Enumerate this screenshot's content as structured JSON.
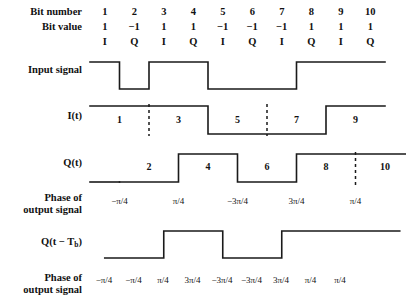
{
  "figure": {
    "type": "timing-diagram"
  },
  "rows": {
    "bit_number_label": "Bit number",
    "bit_value_label": "Bit value",
    "input_signal_label": "Input signal",
    "i_label": "I(t)",
    "q_label": "Q(t)",
    "q_delayed_label": "Q(t − T",
    "q_delayed_sub": "b",
    "q_delayed_tail": ")",
    "phase_label_line1": "Phase of",
    "phase_label_line2": "output signal"
  },
  "bits": {
    "numbers": [
      "1",
      "2",
      "3",
      "4",
      "5",
      "6",
      "7",
      "8",
      "9",
      "10"
    ],
    "values": [
      "1",
      "−1",
      "1",
      "1",
      "−1",
      "−1",
      "−1",
      "1",
      "1",
      "1"
    ],
    "channels": [
      "I",
      "Q",
      "I",
      "Q",
      "I",
      "Q",
      "I",
      "Q",
      "I",
      "Q"
    ]
  },
  "input_signal": {
    "levels": [
      1,
      -1,
      1,
      1,
      -1,
      -1,
      -1,
      1,
      1,
      1
    ]
  },
  "i_channel": {
    "labels": [
      "1",
      "3",
      "5",
      "7",
      "9"
    ],
    "levels": [
      1,
      1,
      -1,
      -1,
      1
    ],
    "dashed_after": [
      0,
      2
    ]
  },
  "q_channel": {
    "labels": [
      "2",
      "4",
      "6",
      "8",
      "10"
    ],
    "levels": [
      -1,
      1,
      -1,
      1,
      1
    ],
    "dashed_after": [
      3
    ]
  },
  "q_delayed": {
    "levels": [
      -1,
      1,
      -1,
      1,
      1
    ]
  },
  "phases_upper": [
    "−π/4",
    "π/4",
    "−3π/4",
    "3π/4",
    "π/4"
  ],
  "phases_lower": [
    "−π/4",
    "−π/4",
    "π/4",
    "3π/4",
    "−3π/4",
    "−3π/4",
    "3π/4",
    "π/4",
    "π/4"
  ],
  "geometry": {
    "origin_x": 90,
    "bit_width": 29.5,
    "bit_count": 10
  },
  "colors": {
    "background": "#ffffff",
    "line": "#1a1a1a",
    "text": "#111111"
  }
}
